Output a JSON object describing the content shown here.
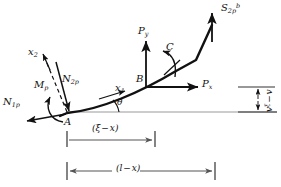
{
  "figure": {
    "background_color": "#ffffff",
    "line_color": "#111111",
    "baseline_color": "#999999"
  },
  "points": [
    {
      "id": "A",
      "label": "A",
      "x": 67,
      "y": 113,
      "role": "left-end-node"
    },
    {
      "id": "B",
      "label": "B",
      "x": 146,
      "y": 78,
      "role": "load-application-node"
    }
  ],
  "forces": [
    {
      "id": "N1p",
      "name": "axial-force-N1p",
      "base": "N",
      "sub": "1p",
      "sup": "",
      "label_x": 3,
      "label_y": 103,
      "direction": "down-left along tangent"
    },
    {
      "id": "N2p",
      "name": "shear-force-N2p",
      "base": "N",
      "sub": "2p",
      "sup": "",
      "label_x": 62,
      "label_y": 80,
      "direction": "down-right perpendicular to tangent"
    },
    {
      "id": "Mp",
      "name": "moment-Mp",
      "base": "M",
      "sub": "p",
      "sup": "",
      "label_x": 36,
      "label_y": 86,
      "direction": "counterclockwise moment at A"
    },
    {
      "id": "Py",
      "name": "applied-force-Py",
      "base": "P",
      "sub": "y",
      "sup": "",
      "label_x": 140,
      "label_y": 32,
      "direction": "vertically upward at B"
    },
    {
      "id": "Px",
      "name": "applied-force-Px",
      "base": "P",
      "sub": "x",
      "sup": "",
      "label_x": 203,
      "label_y": 82,
      "direction": "horizontally right at B"
    },
    {
      "id": "C",
      "name": "applied-couple-C",
      "base": "C",
      "sub": "",
      "sup": "",
      "label_x": 168,
      "label_y": 47,
      "direction": "counterclockwise couple near B"
    },
    {
      "id": "S2pb",
      "name": "end-force-S2p-b",
      "base": "S",
      "sub": "2p",
      "sup": "b",
      "label_x": 222,
      "label_y": 5,
      "direction": "vertically upward at right end"
    }
  ],
  "axes": [
    {
      "id": "x1",
      "name": "local-axis-x1",
      "base": "x",
      "sub": "1",
      "label_x": 117,
      "label_y": 89,
      "description": "tangential local axis"
    },
    {
      "id": "x2",
      "name": "local-axis-x2",
      "base": "x",
      "sub": "2",
      "label_x": 30,
      "label_y": 53,
      "description": "normal local axis"
    }
  ],
  "angles": [
    {
      "id": "theta",
      "name": "slope-angle-theta",
      "symbol": "θ",
      "label_x": 102,
      "label_y": 100,
      "description": "angle between baseline and tangent"
    }
  ],
  "dimensions": [
    {
      "id": "xi-minus-x",
      "name": "dimension-xi-minus-x",
      "text": "(ξ − x)",
      "label_x": 94,
      "label_y": 128,
      "start_x": 67,
      "end_x": 155,
      "y": 140,
      "orientation": "horizontal"
    },
    {
      "id": "l-minus-x",
      "name": "dimension-l-minus-x",
      "text": "(l − x)",
      "label_x": 126,
      "label_y": 159,
      "start_x": 67,
      "end_x": 215,
      "y": 171,
      "orientation": "horizontal"
    },
    {
      "id": "v-xi-minus-v",
      "name": "dimension-v-xi-minus-v",
      "text": "vξ − v",
      "base": "v",
      "sup": "ξ",
      "label_x": 268,
      "label_y": 108,
      "start_y": 88,
      "end_y": 112,
      "x": 258,
      "orientation": "vertical"
    }
  ],
  "geometry": {
    "beam_curve": "M 67,113 C 100,110 140,92 175,72 L 196,60 L 212,24",
    "baseline_y": 112,
    "baseline_start_x": 67,
    "baseline_end_x": 275
  }
}
